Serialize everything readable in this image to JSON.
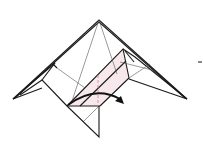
{
  "diagram": {
    "type": "origami-fold-step",
    "colors": {
      "line": "#1a1a1a",
      "crease": "#555555",
      "fold_line": "#d08090",
      "shade": "#f7e8ec",
      "mark": "#888888"
    },
    "elements": [
      "outer-kite-outline",
      "left-flap",
      "center-square-flap",
      "bottom-triangle",
      "dashed-valley-fold-line",
      "curved-fold-arrow",
      "side-mark"
    ]
  }
}
